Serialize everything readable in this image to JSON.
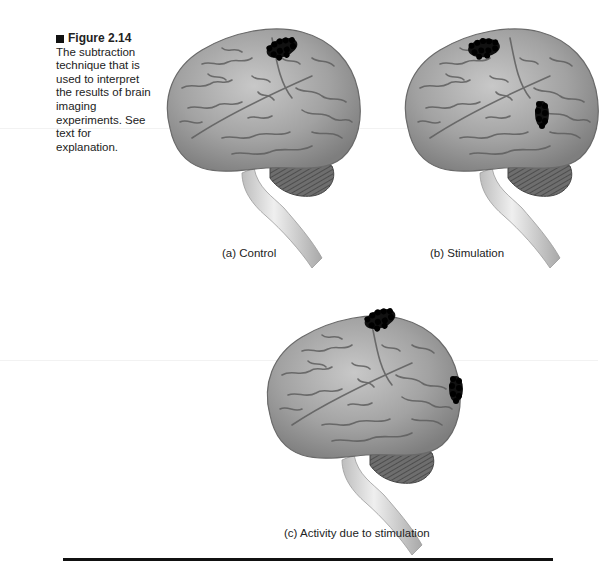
{
  "figure": {
    "number": "Figure 2.14",
    "marker_icon": "square-bullet-icon",
    "caption": "The subtraction technique that is used to interpret the results of brain imaging experiments. See text for explanation."
  },
  "panels": [
    {
      "id": "a",
      "label": "(a) Control",
      "activity_regions": [
        "parietal-top"
      ]
    },
    {
      "id": "b",
      "label": "(b) Stimulation",
      "activity_regions": [
        "parietal-top",
        "occipital"
      ]
    },
    {
      "id": "c",
      "label": "(c) Activity due to stimulation",
      "activity_regions": [
        "parietal-top",
        "occipital"
      ]
    }
  ],
  "colors": {
    "brain_fill": "#9a9a9a",
    "brain_sulci": "#5a5a5a",
    "activity_dots": "#111111",
    "rule": "#111111"
  }
}
